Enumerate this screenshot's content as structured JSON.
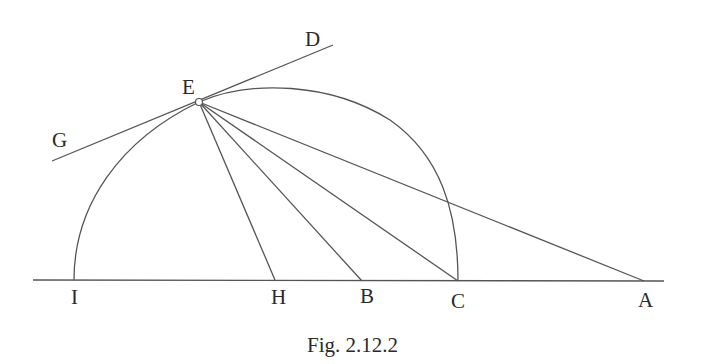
{
  "figure": {
    "caption": "Fig. 2.12.2",
    "stroke_color": "#555555",
    "labels": {
      "D": "D",
      "E": "E",
      "G": "G",
      "I": "I",
      "H": "H",
      "B": "B",
      "C": "C",
      "A": "A"
    },
    "points": {
      "I": [
        74,
        280
      ],
      "H": [
        275,
        280
      ],
      "B": [
        362,
        281
      ],
      "C": [
        458,
        281
      ],
      "A": [
        644,
        281
      ],
      "E": [
        199,
        102
      ],
      "G_end": [
        52,
        161
      ],
      "D_end": [
        333,
        45
      ]
    },
    "segments": [
      "GD (tangent line through E)",
      "EH",
      "EB",
      "EC",
      "EA",
      "baseline through I, H, B, C, A"
    ],
    "arcs": [
      "I to E",
      "E to C"
    ]
  }
}
